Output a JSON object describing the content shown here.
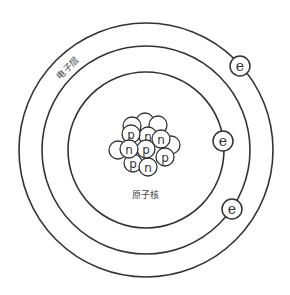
{
  "diagram": {
    "type": "atom-model",
    "center": [
      146,
      150
    ],
    "colors": {
      "stroke": "#333333",
      "fill": "#ffffff",
      "background": "#ffffff"
    },
    "shells": [
      {
        "name": "inner-shell",
        "r": 78
      },
      {
        "name": "middle-shell",
        "r": 104
      },
      {
        "name": "outer-shell",
        "r": 127
      }
    ],
    "shell_label": {
      "text": "电子层",
      "x": 70,
      "y": 70,
      "rotate": -45
    },
    "nucleus_label": {
      "text": "原子核",
      "x": 145,
      "y": 198
    },
    "electrons": [
      {
        "symbol": "e",
        "x": 240,
        "y": 66,
        "shell": "outer-shell"
      },
      {
        "symbol": "e",
        "x": 223,
        "y": 141,
        "shell": "inner-shell"
      },
      {
        "symbol": "e",
        "x": 232,
        "y": 209,
        "shell": "middle-shell"
      }
    ],
    "nucleus_particles": [
      {
        "symbol": "",
        "x": 145,
        "y": 122
      },
      {
        "symbol": "",
        "x": 158,
        "y": 125
      },
      {
        "symbol": "",
        "x": 132,
        "y": 126
      },
      {
        "symbol": "",
        "x": 118,
        "y": 150
      },
      {
        "symbol": "",
        "x": 171,
        "y": 145
      },
      {
        "symbol": "n",
        "x": 148,
        "y": 136
      },
      {
        "symbol": "p",
        "x": 131,
        "y": 134
      },
      {
        "symbol": "n",
        "x": 161,
        "y": 139
      },
      {
        "symbol": "p",
        "x": 133,
        "y": 163
      },
      {
        "symbol": "n",
        "x": 148,
        "y": 167
      },
      {
        "symbol": "p",
        "x": 146,
        "y": 149
      },
      {
        "symbol": "n",
        "x": 129,
        "y": 149
      },
      {
        "symbol": "p",
        "x": 165,
        "y": 157
      }
    ]
  }
}
